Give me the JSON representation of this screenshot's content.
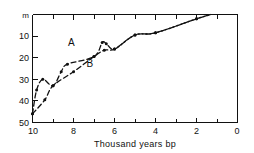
{
  "chart_data": {
    "type": "line",
    "title": "",
    "xlabel": "Thousand  years bp",
    "ylabel": "m",
    "x_ticks": [
      "10",
      "8",
      "6",
      "4",
      "2",
      "0"
    ],
    "x_tick_values": [
      10,
      8,
      6,
      4,
      2,
      0
    ],
    "y_ticks": [
      "m",
      "10",
      "20",
      "30",
      "40",
      "50"
    ],
    "y_tick_values": [
      0,
      10,
      20,
      30,
      40,
      50
    ],
    "xlim": [
      10,
      0
    ],
    "ylim": [
      50,
      0
    ],
    "x_axis_reversed": true,
    "y_axis_reversed": true,
    "grid": false,
    "legend": "inline-labels",
    "series": [
      {
        "name": "A",
        "label": "A",
        "label_x": 8.1,
        "label_y": 14.5,
        "style": "dash-dot",
        "points": [
          {
            "x": 10.0,
            "y": 46.0
          },
          {
            "x": 9.8,
            "y": 35.0
          },
          {
            "x": 9.5,
            "y": 30.0
          },
          {
            "x": 9.0,
            "y": 33.0
          },
          {
            "x": 8.6,
            "y": 26.5
          },
          {
            "x": 8.3,
            "y": 23.0
          },
          {
            "x": 7.0,
            "y": 19.5
          },
          {
            "x": 6.6,
            "y": 13.0
          },
          {
            "x": 6.4,
            "y": 13.5
          },
          {
            "x": 6.0,
            "y": 16.0
          },
          {
            "x": 5.0,
            "y": 9.5
          },
          {
            "x": 4.0,
            "y": 8.5
          },
          {
            "x": 2.0,
            "y": 2.0
          },
          {
            "x": 1.3,
            "y": 0.0
          }
        ]
      },
      {
        "name": "B",
        "label": "B",
        "label_x": 7.2,
        "label_y": 24.5,
        "style": "dash-dot",
        "points": [
          {
            "x": 10.0,
            "y": 46.0
          },
          {
            "x": 9.4,
            "y": 39.5
          },
          {
            "x": 9.0,
            "y": 33.0
          },
          {
            "x": 8.0,
            "y": 26.5
          },
          {
            "x": 7.0,
            "y": 19.5
          },
          {
            "x": 6.5,
            "y": 16.5
          },
          {
            "x": 6.0,
            "y": 16.0
          },
          {
            "x": 5.0,
            "y": 9.5
          },
          {
            "x": 4.0,
            "y": 8.5
          },
          {
            "x": 2.0,
            "y": 2.0
          },
          {
            "x": 1.3,
            "y": 0.0
          }
        ]
      }
    ]
  }
}
